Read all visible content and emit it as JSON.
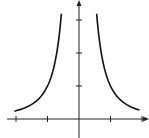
{
  "chart_data": {
    "type": "line",
    "title": "",
    "xlabel": "",
    "ylabel": "",
    "function": "y = 1/x^2",
    "xlim": [
      -2.2,
      2.3
    ],
    "ylim": [
      -0.6,
      3.7
    ],
    "x_ticks": [
      -2,
      -1,
      1,
      2
    ],
    "y_ticks": [
      1,
      2,
      3
    ],
    "tick_labels_shown": false,
    "grid": false,
    "legend": null,
    "series": [
      {
        "name": "left-branch",
        "x": [
          -2,
          -1.5,
          -1,
          -0.8,
          -0.7,
          -0.6,
          -0.55
        ],
        "values": [
          0.25,
          0.44,
          1.0,
          1.56,
          2.04,
          2.78,
          3.3
        ]
      },
      {
        "name": "right-branch",
        "x": [
          0.55,
          0.6,
          0.7,
          0.8,
          1,
          1.5,
          2
        ],
        "values": [
          3.3,
          2.78,
          2.04,
          1.56,
          1.0,
          0.44,
          0.25
        ]
      }
    ],
    "colors": {
      "curve": "#111111",
      "axis": "#222222",
      "background": "#ffffff"
    }
  }
}
